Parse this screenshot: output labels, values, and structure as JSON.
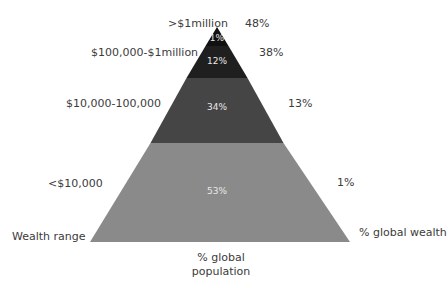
{
  "diagram": {
    "axis_labels": {
      "left": "Wealth range",
      "right": "% global wealth",
      "bottom_line1": "% global",
      "bottom_line2": "population"
    },
    "tiers": [
      {
        "wealth_range": ">$1million",
        "population_pct": "1%",
        "wealth_pct": "48%",
        "color": "#111111"
      },
      {
        "wealth_range": "$100,000-$1million",
        "population_pct": "12%",
        "wealth_pct": "38%",
        "color": "#1f1f1f"
      },
      {
        "wealth_range": "$10,000-100,000",
        "population_pct": "34%",
        "wealth_pct": "13%",
        "color": "#454545"
      },
      {
        "wealth_range": "<$10,000",
        "population_pct": "53%",
        "wealth_pct": "1%",
        "color": "#8a8a8a"
      }
    ]
  }
}
